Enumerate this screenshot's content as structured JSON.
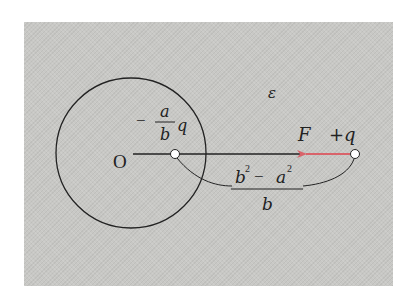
{
  "diagram": {
    "colors": {
      "background": "#c8c8c5",
      "lines": "#222222",
      "force_arrow": "#d9636a",
      "charge_fill": "#ffffff"
    },
    "labels": {
      "center": "O",
      "medium": "ε",
      "image_charge": {
        "sign": "−",
        "numerator": "a",
        "denominator": "b",
        "symbol": "q"
      },
      "real_charge": "+q",
      "force": "F",
      "distance": {
        "numerator_b": "b",
        "numerator_b_exp": "2",
        "numerator_minus": "−",
        "numerator_a": "a",
        "numerator_a_exp": "2",
        "denominator": "b"
      }
    },
    "geometry": {
      "sphere": {
        "cx": 131,
        "cy": 153,
        "r": 75
      },
      "image_charge_pos": {
        "x": 175,
        "y": 154
      },
      "real_charge_pos": {
        "x": 355,
        "y": 154
      },
      "arrow": {
        "from_x": 350,
        "to_x": 300,
        "y": 154
      }
    }
  }
}
